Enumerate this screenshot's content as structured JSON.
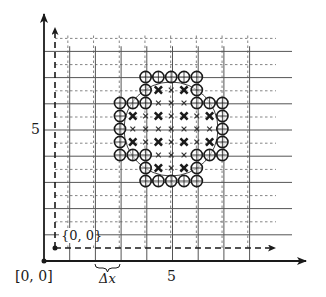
{
  "diagram": {
    "labels": {
      "origin": "[0, 0]",
      "first_node": "{0, 0}",
      "y_tick": "5",
      "x_tick": "5",
      "spacing": "Δx"
    },
    "grid": {
      "coarse_cells_x": 10,
      "coarse_cells_y": 8,
      "refinement": 2
    },
    "circle": {
      "center": [
        5,
        5
      ],
      "radius_cells": 1.85
    },
    "node_pattern_legend": {
      "O": "boundary-circle-node",
      "X": "interior-coarse-node",
      "x": "interior-fine-node",
      ".": "none"
    },
    "node_pattern": [
      "..OOOOO..",
      "..OXxXO..",
      "OOOxxxOOO",
      "OXxXxXxXO",
      "OxxxxxxxO",
      "OXxXxXxXO",
      "OOOxxxOOO",
      "..OXxXO..",
      "..OOOOO.."
    ],
    "colors": {
      "ink": "#1a1a1a",
      "grid": "#555555",
      "dash": "#777777"
    }
  }
}
